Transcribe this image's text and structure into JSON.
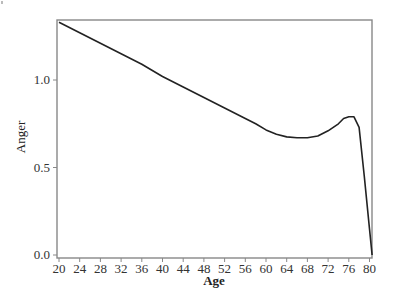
{
  "chart_data": {
    "type": "line",
    "title": "",
    "xlabel": "Age",
    "ylabel": "Anger",
    "xlim": [
      20,
      81
    ],
    "ylim": [
      0.0,
      1.34
    ],
    "x_ticks": [
      20,
      24,
      28,
      32,
      36,
      40,
      44,
      48,
      52,
      56,
      60,
      64,
      68,
      72,
      76,
      80
    ],
    "y_ticks": [
      0.0,
      0.5,
      1.0
    ],
    "y_tick_labels": [
      "0.0",
      "0.5",
      "1.0"
    ],
    "grid": false,
    "legend": null,
    "series": [
      {
        "name": "Anger",
        "color": "#222222",
        "x": [
          20,
          24,
          28,
          32,
          36,
          40,
          44,
          48,
          52,
          56,
          58,
          60,
          62,
          64,
          66,
          68,
          70,
          72,
          74,
          75,
          76,
          77,
          78,
          79,
          80,
          80.5
        ],
        "values": [
          1.33,
          1.27,
          1.21,
          1.15,
          1.09,
          1.02,
          0.96,
          0.9,
          0.84,
          0.78,
          0.75,
          0.715,
          0.69,
          0.675,
          0.67,
          0.67,
          0.68,
          0.71,
          0.75,
          0.78,
          0.79,
          0.79,
          0.73,
          0.45,
          0.15,
          0.0
        ]
      }
    ]
  }
}
